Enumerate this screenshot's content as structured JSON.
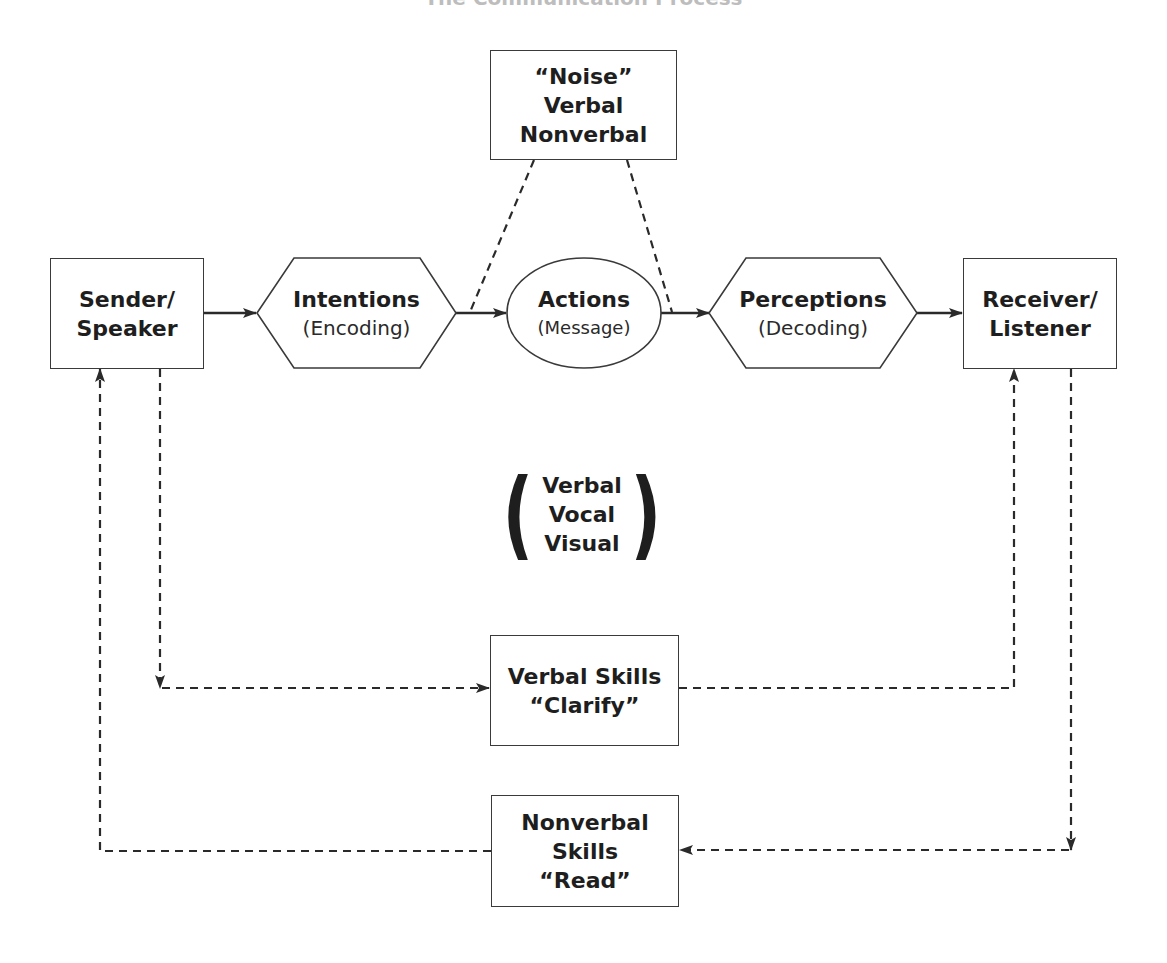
{
  "title": "The Communication Process",
  "nodes": {
    "sender": {
      "line1": "Sender/",
      "line2": "Speaker"
    },
    "intentions": {
      "label": "Intentions",
      "sub": "(Encoding)"
    },
    "actions": {
      "label": "Actions",
      "sub": "(Message)"
    },
    "perceptions": {
      "label": "Perceptions",
      "sub": "(Decoding)"
    },
    "receiver": {
      "line1": "Receiver/",
      "line2": "Listener"
    },
    "noise": {
      "line1": "“Noise”",
      "line2": "Verbal",
      "line3": "Nonverbal"
    },
    "verbal_skills": {
      "line1": "Verbal Skills",
      "line2": "“Clarify”"
    },
    "nonverbal_skills": {
      "line1": "Nonverbal",
      "line2": "Skills",
      "line3": "“Read”"
    }
  },
  "channels": {
    "open": "(",
    "items": [
      "Verbal",
      "Vocal",
      "Visual"
    ],
    "close": ")"
  },
  "colors": {
    "line": "#2a2a2a",
    "border": "#3a3a3a",
    "background": "#ffffff"
  },
  "edges": [
    {
      "from": "sender",
      "to": "intentions",
      "style": "solid"
    },
    {
      "from": "intentions",
      "to": "actions",
      "style": "solid"
    },
    {
      "from": "actions",
      "to": "perceptions",
      "style": "solid"
    },
    {
      "from": "perceptions",
      "to": "receiver",
      "style": "solid"
    },
    {
      "from": "noise",
      "to": "intentions-actions",
      "style": "dashed"
    },
    {
      "from": "noise",
      "to": "actions-perceptions",
      "style": "dashed"
    },
    {
      "from": "sender",
      "to": "verbal_skills",
      "style": "dashed"
    },
    {
      "from": "verbal_skills",
      "to": "receiver",
      "style": "dashed"
    },
    {
      "from": "receiver",
      "to": "nonverbal_skills",
      "style": "dashed"
    },
    {
      "from": "nonverbal_skills",
      "to": "sender",
      "style": "dashed"
    }
  ]
}
